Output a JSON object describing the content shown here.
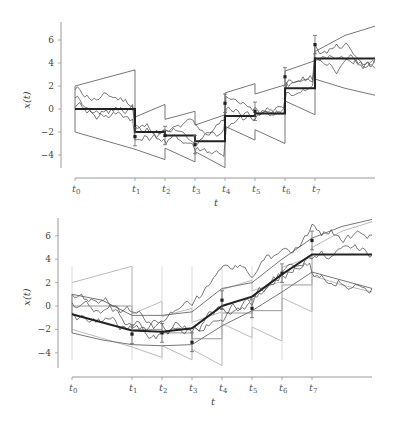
{
  "chart_data": [
    {
      "type": "line",
      "title": "",
      "panel": "top",
      "description": "Piecewise-constant filtering estimate with sample paths and uncertainty envelopes",
      "xlabel": "t",
      "ylabel": "x(t)",
      "ylim": [
        -5,
        7.5
      ],
      "yticks": [
        -4,
        -2,
        0,
        2,
        4,
        6
      ],
      "xticks": [
        "t0",
        "t1",
        "t2",
        "t3",
        "t4",
        "t5",
        "t6",
        "t7"
      ],
      "x_positions": [
        0,
        1,
        1.5,
        2,
        2.5,
        3,
        3.5,
        4
      ],
      "x_end": 5,
      "mean_steps": [
        0,
        -2.0,
        -2.3,
        -2.8,
        -0.6,
        -0.4,
        1.8,
        4.4
      ],
      "upper_envelope": [
        [
          0,
          2.0
        ],
        [
          1,
          3.4
        ],
        [
          1,
          -0.7
        ],
        [
          1.5,
          0.4
        ],
        [
          1.5,
          -0.9
        ],
        [
          2,
          -0.2
        ],
        [
          2,
          -1.4
        ],
        [
          2.5,
          -0.5
        ],
        [
          2.5,
          1.4
        ],
        [
          3,
          2.2
        ],
        [
          3,
          1.3
        ],
        [
          3.5,
          2.1
        ],
        [
          3.5,
          3.3
        ],
        [
          4,
          4.2
        ],
        [
          4,
          5.0
        ],
        [
          4.5,
          6.4
        ],
        [
          5,
          7.2
        ]
      ],
      "lower_envelope": [
        [
          0,
          -2.0
        ],
        [
          1,
          -3.5
        ],
        [
          1.5,
          -4.4
        ],
        [
          1.5,
          -3.4
        ],
        [
          2,
          -4.6
        ],
        [
          2,
          -3.7
        ],
        [
          2.5,
          -5.1
        ],
        [
          2.5,
          -1.5
        ],
        [
          3,
          -2.7
        ],
        [
          3,
          -1.8
        ],
        [
          3.5,
          -3.0
        ],
        [
          3.5,
          0.7
        ],
        [
          4,
          -0.5
        ],
        [
          4,
          2.6
        ],
        [
          4.5,
          1.8
        ],
        [
          5,
          1.2
        ]
      ],
      "observations": {
        "x": [
          1,
          1.5,
          2,
          2.5,
          3,
          3.5,
          4
        ],
        "y": [
          -2.4,
          -2.3,
          -3.1,
          0.5,
          -0.2,
          2.8,
          5.6
        ],
        "error": 0.8
      },
      "sample_paths": 3
    },
    {
      "type": "line",
      "title": "",
      "panel": "bottom",
      "description": "Smoothed estimate with sample paths, uncertainty envelope, and faint filtering envelope",
      "xlabel": "t",
      "ylabel": "x(t)",
      "ylim": [
        -5,
        7.5
      ],
      "yticks": [
        -4,
        -2,
        0,
        2,
        4,
        6
      ],
      "xticks": [
        "t0",
        "t1",
        "t2",
        "t3",
        "t4",
        "t5",
        "t6",
        "t7"
      ],
      "x_positions": [
        0,
        1,
        1.5,
        2,
        2.5,
        3,
        3.5,
        4
      ],
      "x_end": 5,
      "mean_line": [
        [
          0,
          -0.7
        ],
        [
          1,
          -2.1
        ],
        [
          1.5,
          -2.2
        ],
        [
          2,
          -1.9
        ],
        [
          2.5,
          0.0
        ],
        [
          3,
          0.8
        ],
        [
          3.5,
          2.7
        ],
        [
          4,
          4.4
        ],
        [
          5,
          4.4
        ]
      ],
      "upper_envelope": [
        [
          0,
          1.0
        ],
        [
          0.5,
          0.5
        ],
        [
          1,
          -0.8
        ],
        [
          1.5,
          -0.8
        ],
        [
          2,
          -0.5
        ],
        [
          2.5,
          1.5
        ],
        [
          3,
          2.0
        ],
        [
          3.5,
          4.0
        ],
        [
          4,
          5.8
        ],
        [
          4.5,
          6.8
        ],
        [
          5,
          7.4
        ]
      ],
      "lower_envelope": [
        [
          0,
          -2.3
        ],
        [
          0.5,
          -2.9
        ],
        [
          1,
          -3.3
        ],
        [
          1.5,
          -3.4
        ],
        [
          2,
          -3.3
        ],
        [
          2.5,
          -1.7
        ],
        [
          3,
          -0.4
        ],
        [
          3.5,
          1.2
        ],
        [
          4,
          2.9
        ],
        [
          4.5,
          2.2
        ],
        [
          5,
          1.5
        ]
      ],
      "observations": {
        "x": [
          1,
          1.5,
          2,
          2.5,
          3,
          3.5,
          4
        ],
        "y": [
          -2.4,
          -2.3,
          -3.1,
          0.5,
          -0.2,
          2.8,
          5.6
        ],
        "error": 0.8
      },
      "sample_paths": 3
    }
  ],
  "labels": {
    "ylabel": "x(t)",
    "xlabel": "t",
    "yticks": [
      "6",
      "4",
      "2",
      "0",
      "−2",
      "−4"
    ],
    "xticks": [
      {
        "base": "t",
        "sub": "0"
      },
      {
        "base": "t",
        "sub": "1"
      },
      {
        "base": "t",
        "sub": "2"
      },
      {
        "base": "t",
        "sub": "3"
      },
      {
        "base": "t",
        "sub": "4"
      },
      {
        "base": "t",
        "sub": "5"
      },
      {
        "base": "t",
        "sub": "6"
      },
      {
        "base": "t",
        "sub": "7"
      }
    ]
  },
  "colors": {
    "mean": "#222222",
    "envelope": "#777777",
    "faint_envelope": "#bbbbbb",
    "path": "#555555",
    "axis": "#999999",
    "observation": "#222222"
  }
}
